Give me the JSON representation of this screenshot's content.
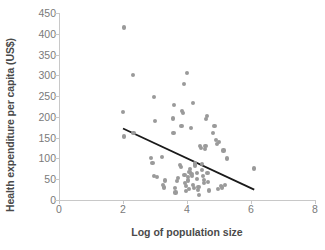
{
  "chart_data": {
    "type": "scatter",
    "title": "",
    "xlabel": "Log of population size",
    "ylabel": "Health expenditure per capita (US$)",
    "xlim": [
      0,
      8
    ],
    "ylim": [
      0,
      450
    ],
    "xticks": [
      0,
      2,
      4,
      6,
      8
    ],
    "yticks": [
      0,
      50,
      100,
      150,
      200,
      250,
      300,
      350,
      400,
      450
    ],
    "grid": false,
    "legend": null,
    "point_color": "#9a9a9a",
    "trendline_color": "#1a1a1a",
    "trendline": {
      "x": [
        2.0,
        6.1
      ],
      "y": [
        172,
        25
      ],
      "description": "negative linear fit"
    },
    "points": [
      [
        2.02,
        415
      ],
      [
        2.01,
        212
      ],
      [
        2.03,
        153
      ],
      [
        2.3,
        301
      ],
      [
        2.33,
        161
      ],
      [
        2.88,
        101
      ],
      [
        2.92,
        90
      ],
      [
        2.96,
        248
      ],
      [
        3.0,
        190
      ],
      [
        2.97,
        57
      ],
      [
        3.06,
        56
      ],
      [
        3.22,
        103
      ],
      [
        3.26,
        37
      ],
      [
        3.28,
        30
      ],
      [
        3.32,
        47
      ],
      [
        3.55,
        196
      ],
      [
        3.58,
        161
      ],
      [
        3.6,
        229
      ],
      [
        3.62,
        28
      ],
      [
        3.64,
        18
      ],
      [
        3.7,
        46
      ],
      [
        3.72,
        52
      ],
      [
        3.78,
        85
      ],
      [
        3.8,
        79
      ],
      [
        3.83,
        178
      ],
      [
        3.85,
        214
      ],
      [
        3.88,
        209
      ],
      [
        3.9,
        280
      ],
      [
        3.92,
        60
      ],
      [
        3.94,
        41
      ],
      [
        3.96,
        33
      ],
      [
        3.98,
        22
      ],
      [
        4.0,
        305
      ],
      [
        4.02,
        55
      ],
      [
        4.04,
        47
      ],
      [
        4.06,
        26
      ],
      [
        4.08,
        68
      ],
      [
        4.1,
        74
      ],
      [
        4.12,
        173
      ],
      [
        4.14,
        62
      ],
      [
        4.16,
        57
      ],
      [
        4.18,
        36
      ],
      [
        4.2,
        234
      ],
      [
        4.22,
        28
      ],
      [
        4.24,
        83
      ],
      [
        4.26,
        88
      ],
      [
        4.3,
        50
      ],
      [
        4.32,
        64
      ],
      [
        4.34,
        24
      ],
      [
        4.36,
        31
      ],
      [
        4.38,
        13
      ],
      [
        4.4,
        129
      ],
      [
        4.44,
        126
      ],
      [
        4.46,
        86
      ],
      [
        4.48,
        72
      ],
      [
        4.5,
        57
      ],
      [
        4.52,
        48
      ],
      [
        4.54,
        40
      ],
      [
        4.56,
        122
      ],
      [
        4.58,
        129
      ],
      [
        4.6,
        194
      ],
      [
        4.62,
        202
      ],
      [
        4.64,
        65
      ],
      [
        4.66,
        44
      ],
      [
        4.68,
        23
      ],
      [
        4.8,
        161
      ],
      [
        4.86,
        178
      ],
      [
        4.9,
        145
      ],
      [
        4.94,
        135
      ],
      [
        4.96,
        27
      ],
      [
        5.0,
        139
      ],
      [
        5.06,
        33
      ],
      [
        5.1,
        30
      ],
      [
        5.14,
        119
      ],
      [
        5.2,
        36
      ],
      [
        5.26,
        100
      ],
      [
        6.1,
        76
      ]
    ]
  }
}
